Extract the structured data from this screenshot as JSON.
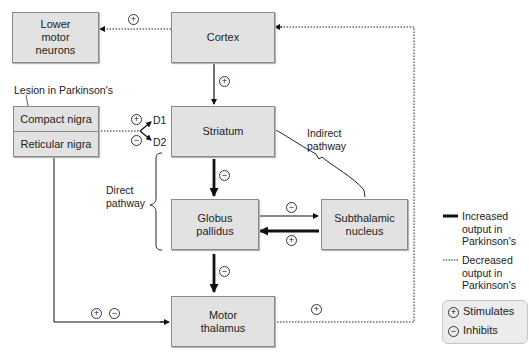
{
  "diagram": {
    "nodes": {
      "lower_motor_neurons": "Lower motor neurons",
      "lower_motor_neurons_lines": [
        "Lower",
        "motor",
        "neurons"
      ],
      "cortex": "Cortex",
      "striatum": "Striatum",
      "compact_nigra": "Compact nigra",
      "reticular_nigra": "Reticular nigra",
      "globus_pallidus_lines": [
        "Globus",
        "pallidus"
      ],
      "subthalamic_nucleus_lines": [
        "Subthalamic",
        "nucleus"
      ],
      "motor_thalamus_lines": [
        "Motor",
        "thalamus"
      ]
    },
    "labels": {
      "lesion": "Lesion in Parkinson's",
      "d1": "D1",
      "d2": "D2",
      "direct_pathway_lines": [
        "Direct",
        "pathway"
      ],
      "indirect_pathway_lines": [
        "Indirect",
        "pathway"
      ]
    },
    "edges": [
      {
        "from": "Cortex",
        "to": "Lower motor neurons",
        "sign": "+",
        "style": "dotted"
      },
      {
        "from": "Cortex",
        "to": "Striatum",
        "sign": "+",
        "style": "thin"
      },
      {
        "from": "Compact nigra",
        "to": "Striatum D1",
        "sign": "+",
        "style": "dotted"
      },
      {
        "from": "Compact nigra",
        "to": "Striatum D2",
        "sign": "-",
        "style": "dotted"
      },
      {
        "from": "Striatum",
        "to": "Globus pallidus",
        "sign": "-",
        "style": "thick"
      },
      {
        "from": "Globus pallidus",
        "to": "Subthalamic nucleus",
        "sign": "-",
        "style": "thin"
      },
      {
        "from": "Subthalamic nucleus",
        "to": "Globus pallidus",
        "sign": "+",
        "style": "thick"
      },
      {
        "from": "Globus pallidus",
        "to": "Motor thalamus",
        "sign": "-",
        "style": "thick"
      },
      {
        "from": "Reticular nigra",
        "to": "Motor thalamus",
        "sign": "+ -",
        "style": "thin"
      },
      {
        "from": "Motor thalamus",
        "to": "Cortex",
        "sign": "+",
        "style": "dotted"
      }
    ],
    "symbols": {
      "plus": "+",
      "minus": "−"
    },
    "legend": {
      "increased": [
        "Increased",
        "output in",
        "Parkinson's"
      ],
      "decreased": [
        "Decreased",
        "output in",
        "Parkinson's"
      ],
      "stimulates": "Stimulates",
      "inhibits": "Inhibits"
    },
    "colors": {
      "box_fill": "#e2e2e2",
      "box_border": "#8a8a8a",
      "line": "#111111",
      "legend_fill": "#ececec"
    }
  }
}
